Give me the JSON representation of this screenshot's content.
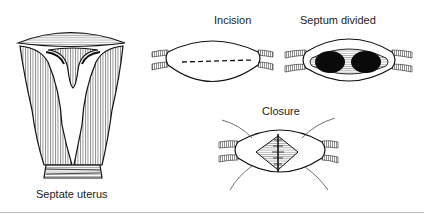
{
  "figure": {
    "panels": [
      {
        "id": "septate",
        "label": "Septate uterus"
      },
      {
        "id": "incision",
        "label": "Incision"
      },
      {
        "id": "divided",
        "label": "Septum divided"
      },
      {
        "id": "closure",
        "label": "Closure"
      }
    ],
    "colors": {
      "ink": "#111111",
      "hatch": "#555555",
      "fill": "#ffffff",
      "rule": "#b8b8b8"
    }
  }
}
